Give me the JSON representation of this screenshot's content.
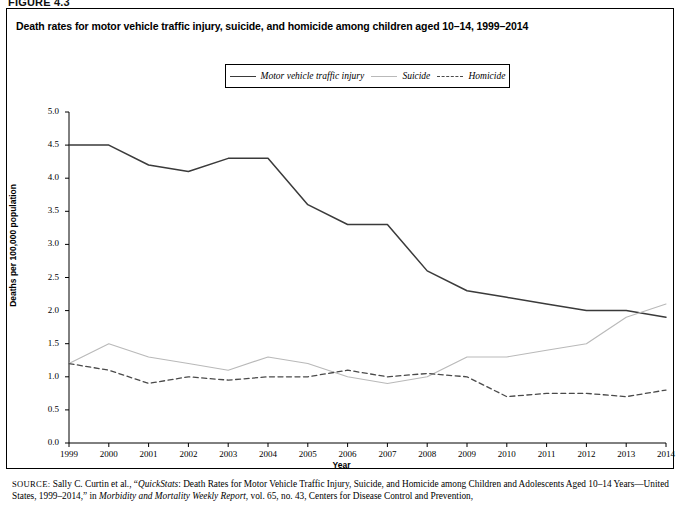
{
  "figure": {
    "number": "FIGURE 4.3",
    "title": "Death rates for motor vehicle traffic injury, suicide, and homicide among children aged 10–14, 1999–2014"
  },
  "legend": {
    "items": [
      {
        "label": "Motor vehicle traffic injury",
        "style": "solid-dark",
        "color": "#3a3a3a"
      },
      {
        "label": "Suicide",
        "style": "solid-light",
        "color": "#b9b9b9"
      },
      {
        "label": "Homicide",
        "style": "dashed",
        "color": "#4a4a4a"
      }
    ]
  },
  "source": {
    "prefix": "SOURCE:",
    "line1_a": " Sally C. Curtin et al., “",
    "line1_italic1": "QuickStats",
    "line1_b": ": Death Rates for Motor Vehicle Traffic Injury, Suicide, and Homicide among Children and Adolescents Aged 10–14 Years—United States, 1999–2014,” in ",
    "line1_italic2": "Morbidity and Mortality Weekly Report",
    "line1_c": ", vol. 65, no. 43, Centers for Disease Control and Prevention,"
  },
  "chart_data": {
    "type": "line",
    "title": "Death rates for motor vehicle traffic injury, suicide, and homicide among children aged 10–14, 1999–2014",
    "xlabel": "Year",
    "ylabel": "Deaths per 100,000 population",
    "categories": [
      1999,
      2000,
      2001,
      2002,
      2003,
      2004,
      2005,
      2006,
      2007,
      2008,
      2009,
      2010,
      2011,
      2012,
      2013,
      2014
    ],
    "x": [
      "1999",
      "2000",
      "2001",
      "2002",
      "2003",
      "2004",
      "2005",
      "2006",
      "2007",
      "2008",
      "2009",
      "2010",
      "2011",
      "2012",
      "2013",
      "2014"
    ],
    "ylim": [
      0.0,
      5.0
    ],
    "yticks": [
      "0.0",
      "0.5",
      "1.0",
      "1.5",
      "2.0",
      "2.5",
      "3.0",
      "3.5",
      "4.0",
      "4.5",
      "5.0"
    ],
    "grid": false,
    "legend_position": "top-center",
    "series": [
      {
        "name": "Motor vehicle traffic injury",
        "color": "#3a3a3a",
        "style": "solid",
        "values": [
          4.5,
          4.5,
          4.2,
          4.1,
          4.3,
          4.3,
          3.6,
          3.3,
          3.3,
          2.6,
          2.3,
          2.2,
          2.1,
          2.0,
          2.0,
          1.9
        ]
      },
      {
        "name": "Suicide",
        "color": "#b9b9b9",
        "style": "solid",
        "values": [
          1.2,
          1.5,
          1.3,
          1.2,
          1.1,
          1.3,
          1.2,
          1.0,
          0.9,
          1.0,
          1.3,
          1.3,
          1.4,
          1.5,
          1.9,
          2.1
        ]
      },
      {
        "name": "Homicide",
        "color": "#4a4a4a",
        "style": "dashed",
        "values": [
          1.2,
          1.1,
          0.9,
          1.0,
          0.95,
          1.0,
          1.0,
          1.1,
          1.0,
          1.05,
          1.0,
          0.7,
          0.75,
          0.75,
          0.7,
          0.8
        ]
      }
    ]
  }
}
